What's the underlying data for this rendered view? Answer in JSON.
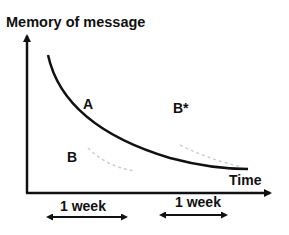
{
  "diagram": {
    "y_axis_title": "Memory of message",
    "x_axis_title": "Time",
    "labels": {
      "A": "A",
      "B": "B",
      "B_star": "B*"
    },
    "intervals": [
      {
        "label": "1 week"
      },
      {
        "label": "1 week"
      }
    ],
    "colors": {
      "main_curve": "#111111",
      "dashed_curves": "#cfcfcf",
      "axes": "#111111"
    }
  }
}
